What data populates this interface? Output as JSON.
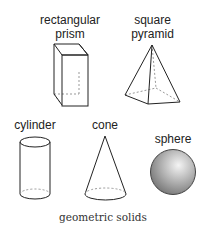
{
  "diagram": {
    "caption": "geometric solids",
    "shapes": [
      {
        "id": "rectangular-prism",
        "label_line1": "rectangular",
        "label_line2": "prism"
      },
      {
        "id": "square-pyramid",
        "label_line1": "square",
        "label_line2": "pyramid"
      },
      {
        "id": "cylinder",
        "label": "cylinder"
      },
      {
        "id": "cone",
        "label": "cone"
      },
      {
        "id": "sphere",
        "label": "sphere"
      }
    ],
    "colors": {
      "line": "#222222",
      "hidden_edge": "#999999",
      "sphere_light": "#f2f2f2",
      "sphere_dark": "#7a7a7a"
    }
  }
}
